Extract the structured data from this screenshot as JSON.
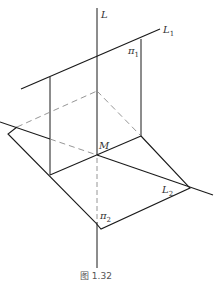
{
  "figure": {
    "caption": "图  1.32",
    "labels": {
      "L": "L",
      "L1": "L",
      "L1_sub": "1",
      "pi1": "π",
      "pi1_sub": "1",
      "M": "M",
      "L2": "L",
      "L2_sub": "2",
      "pi2": "π",
      "pi2_sub": "2"
    },
    "colors": {
      "line": "#1a1a1a",
      "dashed": "#8a8a8a",
      "background": "#ffffff"
    }
  }
}
